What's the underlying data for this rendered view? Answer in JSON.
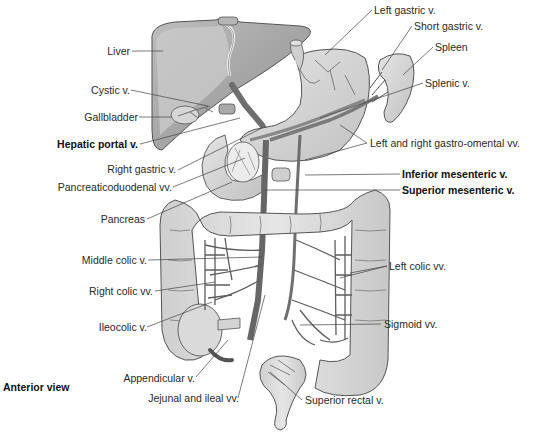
{
  "figure": {
    "view_label": "Anterior view",
    "colors": {
      "background": "#ffffff",
      "organ_fill": "#d9d9d9",
      "organ_dark": "#9a9a9a",
      "vein": "#6e6e6e",
      "outline": "#555555",
      "label_text": "#2a2a2a",
      "leader_line": "#444444"
    }
  },
  "labels": {
    "left": [
      {
        "id": "liver",
        "text": "Liver",
        "bold": false
      },
      {
        "id": "cystic_v",
        "text": "Cystic v.",
        "bold": false
      },
      {
        "id": "gallbladder",
        "text": "Gallbladder",
        "bold": false
      },
      {
        "id": "hepatic_portal_v",
        "text": "Hepatic portal v.",
        "bold": true
      },
      {
        "id": "right_gastric_v",
        "text": "Right gastric v.",
        "bold": false
      },
      {
        "id": "pancreaticoduodenal_vv",
        "text": "Pancreaticoduodenal vv.",
        "bold": false
      },
      {
        "id": "pancreas",
        "text": "Pancreas",
        "bold": false
      },
      {
        "id": "middle_colic_v",
        "text": "Middle colic v.",
        "bold": false
      },
      {
        "id": "right_colic_vv",
        "text": "Right colic vv.",
        "bold": false
      },
      {
        "id": "ileocolic_v",
        "text": "Ileocolic v.",
        "bold": false
      },
      {
        "id": "appendicular_v",
        "text": "Appendicular v.",
        "bold": false
      },
      {
        "id": "jejunal_ileal_vv",
        "text": "Jejunal and ileal vv.",
        "bold": false
      }
    ],
    "right": [
      {
        "id": "left_gastric_v",
        "text": "Left gastric v.",
        "bold": false
      },
      {
        "id": "short_gastric_v",
        "text": "Short gastric v.",
        "bold": false
      },
      {
        "id": "spleen",
        "text": "Spleen",
        "bold": false
      },
      {
        "id": "splenic_v",
        "text": "Splenic v.",
        "bold": false
      },
      {
        "id": "gastro_omental_vv",
        "text": "Left and right gastro-omental vv.",
        "bold": false
      },
      {
        "id": "inferior_mesenteric_v",
        "text": "Inferior mesenteric v.",
        "bold": true
      },
      {
        "id": "superior_mesenteric_v",
        "text": "Superior mesenteric v.",
        "bold": true
      },
      {
        "id": "left_colic_vv",
        "text": "Left colic vv.",
        "bold": false
      },
      {
        "id": "sigmoid_vv",
        "text": "Sigmoid vv.",
        "bold": false
      },
      {
        "id": "superior_rectal_v",
        "text": "Superior rectal v.",
        "bold": false
      }
    ]
  }
}
